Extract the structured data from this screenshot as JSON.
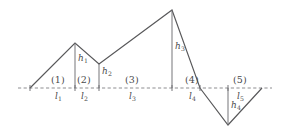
{
  "figure": {
    "type": "line-profile-diagram",
    "colors": {
      "profile_stroke": "#58585a",
      "baseline_stroke": "#8d8d90",
      "height_line_stroke": "#6f6f72",
      "text": "#4a4a4c",
      "background": "#ffffff"
    },
    "baseline": {
      "label": "reference-line",
      "y": 88,
      "x_start": 18,
      "x_end": 272,
      "style": "dashed"
    },
    "profile_points": [
      {
        "x": 30,
        "y": 88,
        "name": "start-on-baseline"
      },
      {
        "x": 75,
        "y": 43,
        "name": "peak-1"
      },
      {
        "x": 99,
        "y": 64,
        "name": "saddle-1"
      },
      {
        "x": 172,
        "y": 10,
        "name": "peak-2"
      },
      {
        "x": 200,
        "y": 88,
        "name": "baseline-crossing"
      },
      {
        "x": 228,
        "y": 125,
        "name": "trough-1"
      },
      {
        "x": 262,
        "y": 88,
        "name": "end-on-baseline"
      }
    ],
    "segments": [
      {
        "index": "(1)",
        "length_label": "l",
        "length_sub": "1",
        "seg_x": 57,
        "len_x": 59,
        "x_start": 30,
        "x_end": 75
      },
      {
        "index": "(2)",
        "length_label": "l",
        "length_sub": "2",
        "seg_x": 82,
        "len_x": 84,
        "x_start": 75,
        "x_end": 99
      },
      {
        "index": "(3)",
        "length_label": "l",
        "length_sub": "3",
        "seg_x": 130,
        "len_x": 132,
        "x_start": 99,
        "x_end": 172
      },
      {
        "index": "(4)",
        "length_label": "l",
        "length_sub": "4",
        "seg_x": 190,
        "len_x": 192,
        "x_start": 172,
        "x_end": 200
      },
      {
        "index": "(5)",
        "length_label": "l",
        "length_sub": "5",
        "seg_x": 238,
        "len_x": 240,
        "x_start": 200,
        "x_end": 262
      }
    ],
    "heights": [
      {
        "label": "h",
        "sub": "1",
        "x": 75,
        "y_top": 43,
        "y_bottom": 88,
        "text_x": 78,
        "text_y": 58,
        "side": "right"
      },
      {
        "label": "h",
        "sub": "2",
        "x": 99,
        "y_top": 64,
        "y_bottom": 88,
        "text_x": 102,
        "text_y": 70,
        "side": "right"
      },
      {
        "label": "h",
        "sub": "3",
        "x": 172,
        "y_top": 10,
        "y_bottom": 88,
        "text_x": 175,
        "text_y": 45,
        "side": "right"
      },
      {
        "label": "h",
        "sub": "4",
        "x": 228,
        "y_top": 88,
        "y_bottom": 125,
        "text_x": 231,
        "text_y": 104,
        "side": "right"
      }
    ],
    "axis_ticks": [
      {
        "name": "tick-seg-1-2",
        "x": 75
      },
      {
        "name": "tick-seg-2-3",
        "x": 99
      },
      {
        "name": "tick-seg-3-4",
        "x": 172
      },
      {
        "name": "tick-seg-4-5",
        "x": 228
      }
    ]
  }
}
